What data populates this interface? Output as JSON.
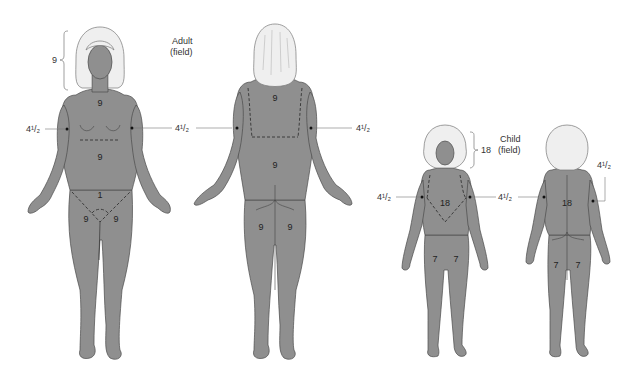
{
  "diagram": {
    "adult": {
      "title_line1": "Adult",
      "title_line2": "(field)",
      "front": {
        "head": "9",
        "chest": "9",
        "abdomen": "9",
        "perineum": "1",
        "left_leg": "9",
        "right_leg": "9",
        "left_arm": "4¹/₂",
        "right_arm": "4¹/₂"
      },
      "back": {
        "upper_back": "9",
        "lower_back": "9",
        "left_leg": "9",
        "right_leg": "9",
        "left_arm": "4¹/₂",
        "right_arm": "4¹/₂"
      }
    },
    "child": {
      "title_line1": "Child",
      "title_line2": "(field)",
      "front": {
        "head": "18",
        "trunk": "18",
        "left_leg": "7",
        "right_leg": "7",
        "left_arm": "4¹/₂",
        "right_arm": "4¹/₂"
      },
      "back": {
        "trunk": "18",
        "left_leg": "7",
        "right_leg": "7",
        "left_arm": "4¹/₂",
        "right_arm": "4¹/₂"
      }
    },
    "colors": {
      "body_fill": "#8f8f8f",
      "hair_fill": "#efefef",
      "outline": "#4a4a4a",
      "background": "#ffffff"
    }
  }
}
